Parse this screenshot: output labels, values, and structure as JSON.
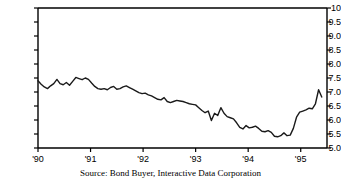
{
  "source_note": "Source: Bond Buyer, Interactive Data Corporation",
  "chart_data": {
    "type": "line",
    "title": "",
    "xlabel": "",
    "ylabel": "",
    "xlim": [
      1990.0,
      1995.5
    ],
    "ylim": [
      5.0,
      10.0
    ],
    "grid": false,
    "legend": "none",
    "line_color": "#1a1a1a",
    "x_tick_labels": [
      "'90",
      "'91",
      "'92",
      "'93",
      "'94",
      "'95"
    ],
    "x_tick_values": [
      1990,
      1991,
      1992,
      1993,
      1994,
      1995
    ],
    "y_tick_labels": [
      "10",
      "9.5",
      "9.0",
      "8.5",
      "8.0",
      "7.5",
      "7.0",
      "6.5",
      "6.0",
      "5.5",
      "5.0"
    ],
    "y_tick_values": [
      10.0,
      9.5,
      9.0,
      8.5,
      8.0,
      7.5,
      7.0,
      6.5,
      6.0,
      5.5,
      5.0
    ],
    "y_minor_step": 0.5,
    "series": [
      {
        "name": "Bond Buyer municipal bond yield index",
        "x": [
          1990.0,
          1990.06,
          1990.12,
          1990.18,
          1990.24,
          1990.3,
          1990.36,
          1990.42,
          1990.48,
          1990.54,
          1990.6,
          1990.66,
          1990.72,
          1990.78,
          1990.84,
          1990.9,
          1990.96,
          1991.02,
          1991.08,
          1991.14,
          1991.2,
          1991.26,
          1991.32,
          1991.38,
          1991.44,
          1991.5,
          1991.56,
          1991.62,
          1991.68,
          1991.74,
          1991.8,
          1991.86,
          1991.92,
          1991.98,
          1992.04,
          1992.1,
          1992.16,
          1992.22,
          1992.28,
          1992.34,
          1992.4,
          1992.46,
          1992.52,
          1992.58,
          1992.64,
          1992.7,
          1992.76,
          1992.82,
          1992.88,
          1992.94,
          1993.0,
          1993.06,
          1993.12,
          1993.18,
          1993.24,
          1993.3,
          1993.36,
          1993.42,
          1993.48,
          1993.54,
          1993.6,
          1993.66,
          1993.72,
          1993.78,
          1993.84,
          1993.9,
          1993.96,
          1994.02,
          1994.08,
          1994.14,
          1994.2,
          1994.26,
          1994.32,
          1994.38,
          1994.44,
          1994.5,
          1994.56,
          1994.62,
          1994.68,
          1994.74,
          1994.8,
          1994.86,
          1994.92,
          1994.98,
          1995.04,
          1995.1,
          1995.16,
          1995.22,
          1995.28,
          1995.34,
          1995.4
        ],
        "y": [
          7.4,
          7.28,
          7.18,
          7.12,
          7.22,
          7.3,
          7.45,
          7.3,
          7.26,
          7.34,
          7.24,
          7.38,
          7.52,
          7.48,
          7.44,
          7.5,
          7.45,
          7.32,
          7.2,
          7.12,
          7.1,
          7.12,
          7.08,
          7.16,
          7.2,
          7.1,
          7.12,
          7.18,
          7.22,
          7.16,
          7.1,
          7.04,
          6.98,
          6.94,
          6.96,
          6.9,
          6.86,
          6.8,
          6.74,
          6.72,
          6.8,
          6.66,
          6.62,
          6.66,
          6.7,
          6.68,
          6.66,
          6.62,
          6.58,
          6.56,
          6.54,
          6.44,
          6.34,
          6.26,
          6.32,
          5.98,
          6.24,
          6.16,
          6.44,
          6.24,
          6.12,
          6.08,
          6.04,
          5.9,
          5.74,
          5.68,
          5.8,
          5.72,
          5.74,
          5.78,
          5.7,
          5.6,
          5.58,
          5.62,
          5.56,
          5.42,
          5.4,
          5.44,
          5.54,
          5.44,
          5.46,
          5.7,
          6.1,
          6.28,
          6.32,
          6.36,
          6.42,
          6.4,
          6.58,
          7.08,
          6.82
        ]
      }
    ]
  }
}
